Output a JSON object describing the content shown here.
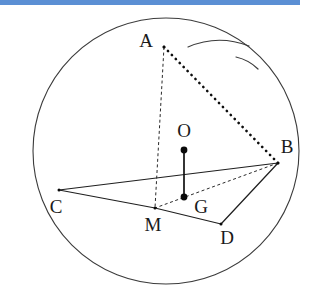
{
  "figure": {
    "background_color": "#ffffff",
    "accent_bar_color": "#5b8fd4",
    "line_color": "#1f1f1f",
    "outline_color": "#3b3b3b"
  },
  "top_bar": {
    "name": "top-accent-bar",
    "color": "#5b8fd4",
    "width": 300,
    "height": 5
  },
  "circle": {
    "name": "sphere-outline",
    "cx": 166,
    "cy": 151,
    "r": 133,
    "stroke": "#3b3b3b"
  },
  "arc_marks": [
    {
      "name": "sphere-highlight-arc-upper",
      "d": "M 188 47 Q 218 34 249 46"
    },
    {
      "name": "sphere-highlight-arc-lower",
      "d": "M 236 57 Q 249 60 258 69"
    }
  ],
  "points": [
    {
      "id": "A",
      "label": "A",
      "x": 164,
      "y": 47,
      "label_x": 146,
      "label_y": 43,
      "marker": "tick"
    },
    {
      "id": "B",
      "label": "B",
      "x": 278,
      "y": 163,
      "label_x": 287,
      "label_y": 149,
      "marker": "tick"
    },
    {
      "id": "C",
      "label": "C",
      "x": 59,
      "y": 190,
      "label_x": 56,
      "label_y": 209,
      "marker": "tick"
    },
    {
      "id": "D",
      "label": "D",
      "x": 221,
      "y": 224,
      "label_x": 227,
      "label_y": 240,
      "marker": "tick"
    },
    {
      "id": "M",
      "label": "M",
      "x": 155,
      "y": 208,
      "label_x": 153,
      "label_y": 227,
      "marker": "tick"
    },
    {
      "id": "O",
      "label": "O",
      "x": 184,
      "y": 150,
      "label_x": 184,
      "label_y": 133,
      "marker": "dot"
    },
    {
      "id": "G",
      "label": "G",
      "x": 184,
      "y": 197,
      "label_x": 201,
      "label_y": 209,
      "marker": "dot"
    }
  ],
  "edges": [
    {
      "name": "edge-C-B",
      "from": "C",
      "to": "B",
      "style": "solid"
    },
    {
      "name": "edge-C-M",
      "from": "C",
      "to": "M",
      "style": "solid"
    },
    {
      "name": "edge-M-D",
      "from": "M",
      "to": "D",
      "style": "solid"
    },
    {
      "name": "edge-B-D",
      "from": "B",
      "to": "D",
      "style": "solid"
    },
    {
      "name": "edge-A-B",
      "from": "A",
      "to": "B",
      "style": "dotted-heavy"
    },
    {
      "name": "edge-A-M",
      "from": "A",
      "to": "M",
      "style": "dashed-fine"
    },
    {
      "name": "edge-B-M",
      "from": "B",
      "to": "M",
      "style": "dashed-fine"
    },
    {
      "name": "segment-O-G",
      "from": "O",
      "to": "G",
      "style": "solid-thick"
    }
  ],
  "labels": {
    "A": "A",
    "B": "B",
    "C": "C",
    "D": "D",
    "M": "M",
    "O": "O",
    "G": "G"
  }
}
